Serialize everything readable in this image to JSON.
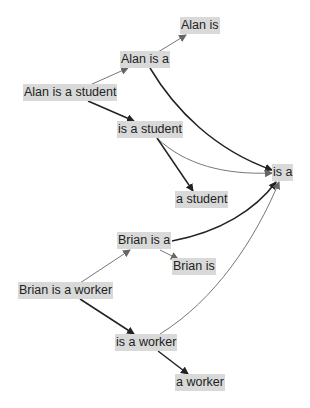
{
  "diagram": {
    "type": "directed-graph",
    "nodes": {
      "alan_is": "Alan is",
      "alan_is_a": "Alan is a",
      "alan_is_a_student": "Alan is a student",
      "is_a_student": "is a student",
      "is_a": "is a",
      "a_student": "a student",
      "brian_is_a": "Brian is a",
      "brian_is": "Brian is",
      "brian_is_a_worker": "Brian is a worker",
      "is_a_worker": "is a worker",
      "a_worker": "a worker"
    },
    "edges": [
      {
        "from": "Alan is a student",
        "to": "Alan is a",
        "weight": "thin"
      },
      {
        "from": "Alan is a",
        "to": "Alan is",
        "weight": "thin"
      },
      {
        "from": "Alan is a student",
        "to": "is a student",
        "weight": "thick"
      },
      {
        "from": "Alan is a",
        "to": "is a",
        "weight": "thick"
      },
      {
        "from": "is a student",
        "to": "is a",
        "weight": "thin"
      },
      {
        "from": "is a student",
        "to": "a student",
        "weight": "thick"
      },
      {
        "from": "Brian is a worker",
        "to": "Brian is a",
        "weight": "thin"
      },
      {
        "from": "Brian is a",
        "to": "Brian is",
        "weight": "thin"
      },
      {
        "from": "Brian is a",
        "to": "is a",
        "weight": "thick"
      },
      {
        "from": "Brian is a worker",
        "to": "is a worker",
        "weight": "thick"
      },
      {
        "from": "is a worker",
        "to": "is a",
        "weight": "thin"
      },
      {
        "from": "is a worker",
        "to": "a worker",
        "weight": "thick"
      }
    ],
    "colors": {
      "node_bg": "#d9d9d9",
      "edge_thick": "#222222",
      "edge_thin": "#777777"
    }
  }
}
